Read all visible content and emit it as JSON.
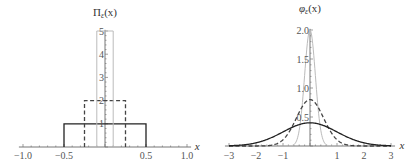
{
  "chart_data": [
    {
      "type": "line",
      "title": "",
      "ylabel": "Π_ε(x)",
      "xlabel": "x",
      "xlim": [
        -1.0,
        1.0
      ],
      "ylim": [
        0,
        5
      ],
      "x_ticks": [
        "-1.0",
        "-0.5",
        "0.5",
        "1.0"
      ],
      "y_ticks": [
        "1",
        "2",
        "3",
        "4",
        "5"
      ],
      "series": [
        {
          "name": "ε=1 (solid)",
          "style": "solid",
          "color": "#222222",
          "shape": "rect",
          "x": [
            -0.5,
            0.5
          ],
          "height": 1
        },
        {
          "name": "ε=0.5 (dashed)",
          "style": "dashed",
          "color": "#444444",
          "shape": "rect",
          "x": [
            -0.25,
            0.25
          ],
          "height": 2
        },
        {
          "name": "ε=0.2 (gray)",
          "style": "solid",
          "color": "#bbbbbb",
          "shape": "rect",
          "x": [
            -0.1,
            0.1
          ],
          "height": 5
        }
      ]
    },
    {
      "type": "line",
      "title": "",
      "ylabel": "φ_ε(x)",
      "xlabel": "x",
      "xlim": [
        -3,
        3
      ],
      "ylim": [
        0,
        2.0
      ],
      "x_ticks": [
        "-3",
        "-2",
        "-1",
        "1",
        "2",
        "3"
      ],
      "y_ticks": [
        "0.5",
        "1.0",
        "1.5",
        "2.0"
      ],
      "series": [
        {
          "name": "ε=1 (solid)",
          "style": "solid",
          "color": "#222222",
          "shape": "gaussian",
          "sigma": 1.0,
          "peak": 0.4
        },
        {
          "name": "ε=0.5 (dashed)",
          "style": "dashed",
          "color": "#444444",
          "shape": "gaussian",
          "sigma": 0.5,
          "peak": 0.8
        },
        {
          "name": "ε=0.2 (gray)",
          "style": "solid",
          "color": "#bbbbbb",
          "shape": "gaussian",
          "sigma": 0.2,
          "peak": 2.0
        }
      ]
    }
  ],
  "left": {
    "ylabel_main": "Π",
    "ylabel_sub": "ε",
    "ylabel_tail": "(x)",
    "xlabel": "x"
  },
  "right": {
    "ylabel_main": "φ",
    "ylabel_sub": "ε",
    "ylabel_tail": "(x)",
    "xlabel": "x"
  }
}
